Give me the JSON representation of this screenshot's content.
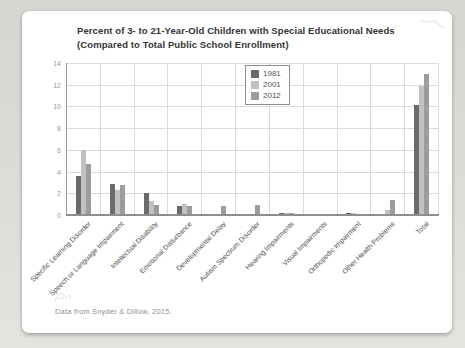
{
  "page": {
    "caption": "Data from Snyder & Dillow, 2015."
  },
  "chart_data": {
    "type": "bar",
    "title_line1": "Percent of 3- to 21-Year-Old Children with Special Educational Needs",
    "title_line2": "(Compared to Total Public School Enrollment)",
    "categories": [
      "Specific Learning Disorder",
      "Speech or Language Impairment",
      "Intellectual Disability",
      "Emotional Disturbance",
      "Developmental Delay",
      "Autism Spectrum Disorder",
      "Hearing Impairments",
      "Visual Impairments",
      "Orthopedic Impairment",
      "Other Health Problems",
      "Total"
    ],
    "series": [
      {
        "name": "1981",
        "color": "#696a6d",
        "values": [
          3.6,
          2.9,
          2.0,
          0.8,
          0,
          0,
          0.2,
          0.1,
          0.15,
          0.1,
          10.1
        ]
      },
      {
        "name": "2001",
        "color": "#bfc1c3",
        "values": [
          6.0,
          2.3,
          1.3,
          1.0,
          0,
          0.1,
          0.15,
          0.05,
          0.15,
          0.5,
          11.9
        ]
      },
      {
        "name": "2012",
        "color": "#9a9c9e",
        "values": [
          4.7,
          2.8,
          0.9,
          0.8,
          0.8,
          0.9,
          0.15,
          0.05,
          0.1,
          1.4,
          13.0
        ]
      }
    ],
    "ylim": [
      0,
      14
    ],
    "ytick_step": 2,
    "grid": true,
    "legend_position": "top-center",
    "xlabel": "",
    "ylabel": ""
  }
}
